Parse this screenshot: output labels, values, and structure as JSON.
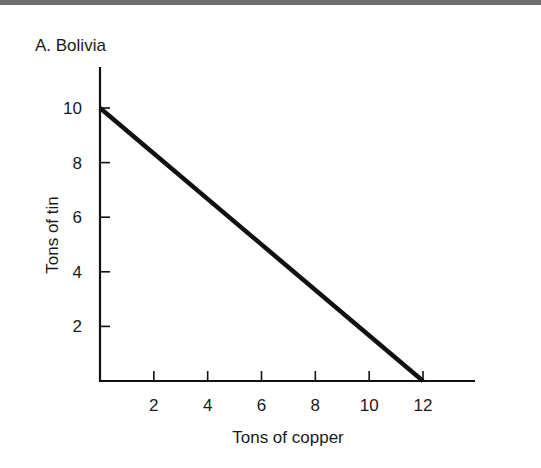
{
  "chart_data": {
    "type": "line",
    "title": "A. Bolivia",
    "xlabel": "Tons of copper",
    "ylabel": "Tons of tin",
    "x_ticks": [
      2,
      4,
      6,
      8,
      10,
      12
    ],
    "y_ticks": [
      2,
      4,
      6,
      8,
      10
    ],
    "xlim": [
      0,
      14
    ],
    "ylim": [
      0,
      11
    ],
    "grid": false,
    "legend": null,
    "series": [
      {
        "name": "Production possibilities frontier",
        "x": [
          0,
          12
        ],
        "y": [
          10,
          0
        ]
      }
    ]
  },
  "header": {
    "bar_color": "#6e6e6e"
  }
}
